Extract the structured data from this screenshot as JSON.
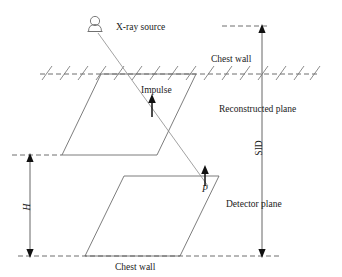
{
  "figure": {
    "background_color": "#ffffff",
    "line_color": "#6e6e6e",
    "text_color": "#1a1a1a",
    "arrow_color": "#111111"
  },
  "labels": {
    "xray_source": "X-ray source",
    "chest_wall_top": "Chest wall",
    "chest_wall_bottom": "Chest wall",
    "impulse": "Impulse",
    "reconstructed_plane": "Reconstructed plane",
    "detector_plane": "Detector plane",
    "sid": "SID",
    "height": "H",
    "point_p": "P"
  },
  "icons": {
    "xray_source_icon": "xray-tube-icon",
    "impulse_arrow_icon": "up-arrow-icon",
    "point_p_arrow_icon": "up-arrow-icon",
    "sid_dimension_icon": "double-headed-vertical-arrow-icon",
    "height_dimension_icon": "double-headed-vertical-arrow-icon",
    "hatching_icon": "hatch-marks-icon"
  },
  "geometry": {
    "xray_source_point": {
      "x": 95,
      "y": 22
    },
    "point_p": {
      "x": 205,
      "y": 175
    },
    "chest_wall_line_y": 74,
    "reconstructed_plane_vertices": "101,74 196,74 157,155 62,155",
    "detector_plane_vertices": "124,176 219,176 180,256 85,256",
    "sid_dimension": {
      "x": 262,
      "top_y": 26,
      "bottom_y": 256
    },
    "height_dimension": {
      "x": 30,
      "top_y": 155,
      "bottom_y": 256
    }
  }
}
